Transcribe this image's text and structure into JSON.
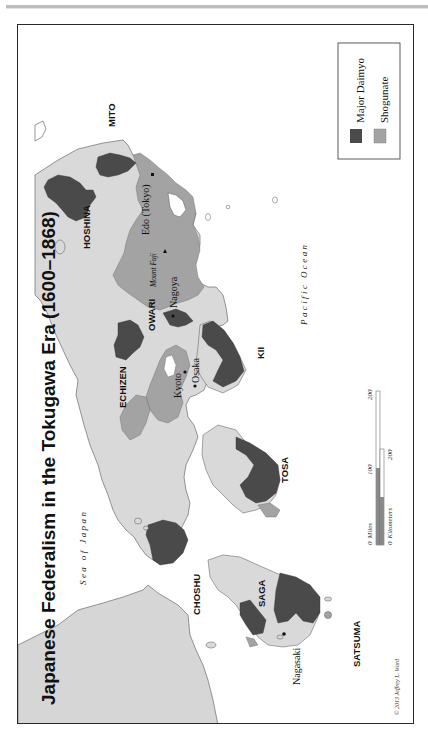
{
  "map": {
    "title": "Japanese Federalism in the Tokugawa Era (1600–1868)",
    "orientation": "rotated 90° counter-clockwise (text reads bottom-to-top)",
    "colors": {
      "major_daimyo": "#4a4a4a",
      "shogunate": "#a3a3a3",
      "other_land": "#d9d9d9",
      "mainland_asia": "#d6d6d6",
      "water": "#ffffff",
      "frame": "#2a2a2a"
    },
    "legend": {
      "items": [
        {
          "label": "Major Daimyo",
          "color": "#4a4a4a"
        },
        {
          "label": "Shogunate",
          "color": "#a3a3a3"
        }
      ]
    },
    "water_labels": {
      "sea_of_japan": "Sea of Japan",
      "pacific_ocean": "Pacific Ocean"
    },
    "domains": {
      "mito": "MITO",
      "hoshina": "HOSHINA",
      "owari": "OWARI",
      "echizen": "ECHIZEN",
      "kii": "KII",
      "tosa": "TOSA",
      "choshu": "CHOSHU",
      "saga": "SAGA",
      "satsuma": "SATSUMA"
    },
    "cities": {
      "edo": "Edo (Tokyo)",
      "fuji": "Mount Fuji",
      "nagoya": "Nagoya",
      "kyoto": "Kyoto",
      "osaka": "Osaka",
      "nagasaki": "Nagasaki"
    },
    "scale_bar": {
      "miles_label": "Miles",
      "miles_ticks": [
        "0",
        "100",
        "200"
      ],
      "km_label": "Kilometers",
      "km_ticks": [
        "0",
        "200"
      ]
    },
    "credit": "© 2013 Jeffrey L. Ward"
  }
}
